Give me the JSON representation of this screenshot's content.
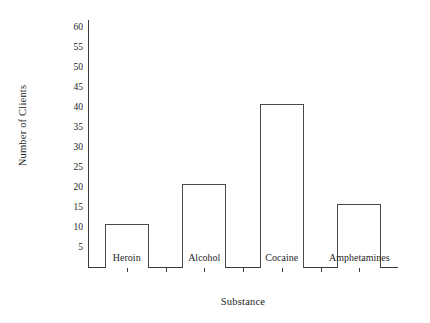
{
  "chart_data": {
    "type": "bar",
    "title": "",
    "xlabel": "Substance",
    "ylabel": "Number of Clients",
    "categories": [
      "Heroin",
      "Alcohol",
      "Cocaine",
      "Amphetamines"
    ],
    "values": [
      11,
      21,
      41,
      16
    ],
    "ylim": [
      0,
      62
    ],
    "yticks": [
      5,
      10,
      15,
      20,
      25,
      30,
      35,
      40,
      45,
      50,
      55,
      60
    ],
    "ytick_labels": [
      "5",
      "10",
      "15",
      "20",
      "25",
      "30",
      "35",
      "40",
      "45",
      "50",
      "55",
      "60"
    ],
    "grid": false,
    "legend": null,
    "bar_style": {
      "fill": "#ffffff",
      "edge_color": "#4a4a4a",
      "edge_width": 1
    },
    "axis_color": "#3a3a3a",
    "background": "#ffffff"
  }
}
